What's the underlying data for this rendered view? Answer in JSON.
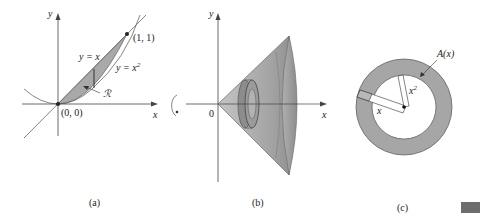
{
  "panels": {
    "a": {
      "caption": "(a)",
      "axis_x": "x",
      "axis_y": "y",
      "point_top": "(1, 1)",
      "point_origin": "(0, 0)",
      "curve_line": "y = x",
      "curve_parabola_base": "y = x",
      "curve_parabola_exp": "2",
      "region": "ℛ"
    },
    "b": {
      "caption": "(b)",
      "axis_x": "x",
      "axis_y": "y",
      "origin": "0"
    },
    "c": {
      "caption": "(c)",
      "area": "A(x)",
      "outer_radius": "x",
      "inner_radius_base": "x",
      "inner_radius_exp": "2"
    }
  },
  "colors": {
    "region_fill": "#a9a9a9",
    "solid_fill": "#9a9a9a",
    "annulus_fill": "#a6a6a6",
    "axis": "#444444",
    "corner_block": "#6d6d6d"
  }
}
